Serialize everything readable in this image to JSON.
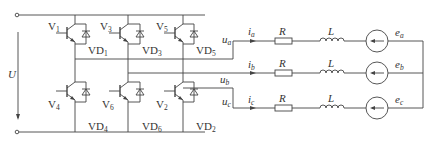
{
  "diagram": {
    "type": "three-phase voltage source inverter with RL load and back-EMF",
    "dc_source": {
      "label": "U"
    },
    "switches": [
      {
        "name": "V",
        "sub": "1",
        "diode": "VD",
        "dsub": "1"
      },
      {
        "name": "V",
        "sub": "3",
        "diode": "VD",
        "dsub": "3"
      },
      {
        "name": "V",
        "sub": "5",
        "diode": "VD",
        "dsub": "5"
      },
      {
        "name": "V",
        "sub": "4",
        "diode": "VD",
        "dsub": "4"
      },
      {
        "name": "V",
        "sub": "6",
        "diode": "VD",
        "dsub": "6"
      },
      {
        "name": "V",
        "sub": "2",
        "diode": "VD",
        "dsub": "2"
      }
    ],
    "phases": [
      {
        "voltage": "u",
        "vsub": "a",
        "current": "i",
        "isub": "a",
        "R": "R",
        "L": "L",
        "emf": "e",
        "esub": "a"
      },
      {
        "voltage": "u",
        "vsub": "b",
        "current": "i",
        "isub": "b",
        "R": "R",
        "L": "L",
        "emf": "e",
        "esub": "b"
      },
      {
        "voltage": "u",
        "vsub": "c",
        "current": "i",
        "isub": "c",
        "R": "R",
        "L": "L",
        "emf": "e",
        "esub": "c"
      }
    ],
    "line_color": "#444444"
  }
}
